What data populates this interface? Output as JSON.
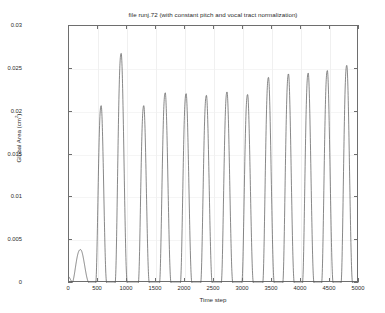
{
  "chart_data": {
    "type": "line",
    "title": "file runj.72 (with constant pitch and vocal tract normalization)",
    "xlabel": "Time step",
    "ylabel": "Global Area (cm2)",
    "ylabel_base": "Global Area (cm",
    "ylabel_sup": "2",
    "ylabel_tail": ")",
    "xlim": [
      0,
      5000
    ],
    "ylim": [
      0,
      0.03
    ],
    "grid": true,
    "legend": null,
    "line_color": "#545454",
    "axis_color": "#6e6e6e",
    "background": "#ffffff",
    "xticks": [
      0,
      500,
      1000,
      1500,
      2000,
      2500,
      3000,
      3500,
      4000,
      4500,
      5000
    ],
    "xtick_labels": [
      "0",
      "500",
      "1000",
      "1500",
      "2000",
      "2500",
      "3000",
      "3500",
      "4000",
      "4500",
      "5000"
    ],
    "yticks": [
      0,
      0.005,
      0.01,
      0.015,
      0.02,
      0.025,
      0.03
    ],
    "ytick_labels": [
      "0",
      "0.005",
      "0.01",
      "0.015",
      "0.02",
      "0.025",
      "0.03"
    ],
    "series": [
      {
        "name": "global area",
        "description": "Quasi-periodic vocal fold glottal area pulses; an initial low-amplitude hump followed by fourteen tall pulses of slowly increasing amplitude.",
        "peaks": [
          {
            "x": 200,
            "y": 0.0039
          },
          {
            "x": 555,
            "y": 0.0207
          },
          {
            "x": 900,
            "y": 0.0268
          },
          {
            "x": 1290,
            "y": 0.0207
          },
          {
            "x": 1660,
            "y": 0.0222
          },
          {
            "x": 2020,
            "y": 0.0221
          },
          {
            "x": 2370,
            "y": 0.0219
          },
          {
            "x": 2725,
            "y": 0.0223
          },
          {
            "x": 3080,
            "y": 0.022
          },
          {
            "x": 3440,
            "y": 0.024
          },
          {
            "x": 3785,
            "y": 0.0244
          },
          {
            "x": 4125,
            "y": 0.0245
          },
          {
            "x": 4455,
            "y": 0.0248
          },
          {
            "x": 4790,
            "y": 0.0254
          }
        ],
        "pulse_half_widths": [
          150,
          95,
          105,
          95,
          100,
          100,
          100,
          100,
          100,
          100,
          100,
          100,
          100,
          100
        ],
        "baseline": 0.0,
        "start_value": 0.0008
      }
    ]
  }
}
